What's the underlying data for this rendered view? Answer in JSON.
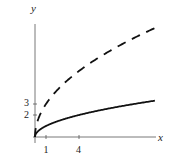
{
  "chart_data": {
    "type": "line",
    "title": "",
    "xlabel": "x",
    "ylabel": "y",
    "x_ticks": [
      1,
      4
    ],
    "y_ticks": [
      2,
      3
    ],
    "xlim": [
      0,
      11
    ],
    "ylim": [
      0,
      11.5
    ],
    "grid": false,
    "legend": null,
    "series": [
      {
        "name": "y = sqrt(x)",
        "style": "solid",
        "color": "#111111",
        "x": [
          0,
          0.25,
          1,
          2,
          4,
          6,
          8,
          10,
          10.9
        ],
        "y": [
          0,
          0.5,
          1,
          1.41,
          2,
          2.45,
          2.83,
          3.16,
          3.3
        ]
      },
      {
        "name": "y = 3*sqrt(x)",
        "style": "dashed",
        "color": "#111111",
        "x": [
          0,
          0.25,
          1,
          2,
          4,
          6,
          8,
          10,
          10.9
        ],
        "y": [
          0,
          1.5,
          3,
          4.24,
          6,
          7.35,
          8.49,
          9.49,
          9.9
        ]
      }
    ]
  },
  "labels": {
    "x_axis": "x",
    "y_axis": "y",
    "x_tick_1": "1",
    "x_tick_4": "4",
    "y_tick_2": "2",
    "y_tick_3": "3"
  }
}
